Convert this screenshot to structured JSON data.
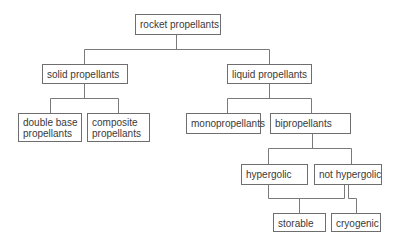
{
  "diagram": {
    "type": "tree",
    "nodes": [
      {
        "id": "rocket",
        "label": "rocket propellants"
      },
      {
        "id": "solid",
        "label": "solid propellants",
        "parent": "rocket"
      },
      {
        "id": "liquid",
        "label": "liquid propellants",
        "parent": "rocket"
      },
      {
        "id": "double_base",
        "label": "double base propellants",
        "lines": [
          "double base",
          "propellants"
        ],
        "parent": "solid"
      },
      {
        "id": "composite",
        "label": "composite propellants",
        "lines": [
          "composite",
          "propellants"
        ],
        "parent": "solid"
      },
      {
        "id": "mono",
        "label": "monopropellants",
        "parent": "liquid"
      },
      {
        "id": "bi",
        "label": "bipropellants",
        "parent": "liquid"
      },
      {
        "id": "hypergolic",
        "label": "hypergolic",
        "parent": "bi"
      },
      {
        "id": "not_hypergolic",
        "label": "not hypergolic",
        "parent": "bi"
      },
      {
        "id": "storable",
        "label": "storable",
        "parent": [
          "hypergolic",
          "not_hypergolic"
        ]
      },
      {
        "id": "cryogenic",
        "label": "cryogenic",
        "parent": "not_hypergolic"
      }
    ],
    "labels": {
      "rocket": "rocket propellants",
      "solid": "solid propellants",
      "liquid": "liquid propellants",
      "double_base_1": "double base",
      "double_base_2": "propellants",
      "composite_1": "composite",
      "composite_2": "propellants",
      "mono": "monopropellants",
      "bi": "bipropellants",
      "hypergolic": "hypergolic",
      "not_hypergolic": "not hypergolic",
      "storable": "storable",
      "cryogenic": "cryogenic"
    },
    "colors": {
      "border": "#6e6e6e",
      "line": "#7a7a7a",
      "text": "#3a3a3a",
      "background": "#ffffff"
    }
  }
}
